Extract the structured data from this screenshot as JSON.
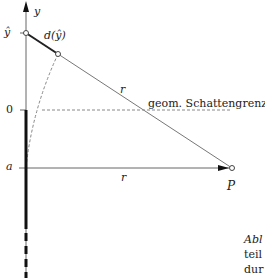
{
  "diagram": {
    "axis_label": "y",
    "y_hat_label": "ŷ",
    "distance_label": "d(ŷ)",
    "zero_label": "0",
    "a_label": "a",
    "r_label_upper": "r",
    "r_label_lower": "r",
    "point_label": "P",
    "shadow_boundary_label": "geom. Schattengrenze"
  },
  "caption": {
    "line1": "Abl",
    "line2": "teil",
    "line3": "dur"
  },
  "colors": {
    "line": "#555555",
    "thick": "#111111",
    "dashed": "#777777"
  }
}
